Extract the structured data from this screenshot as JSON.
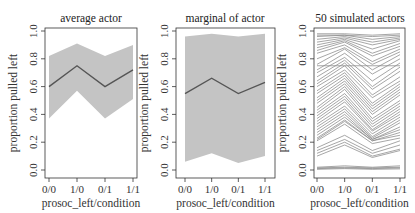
{
  "chart_data": [
    {
      "type": "line",
      "title": "average actor",
      "xlabel": "prosoc_left/condition",
      "ylabel": "proportion pulled left",
      "categories": [
        "0/0",
        "1/0",
        "0/1",
        "1/1"
      ],
      "ylim": [
        0,
        1
      ],
      "yticks": [
        "0.0",
        "0.2",
        "0.4",
        "0.6",
        "0.8",
        "1.0"
      ],
      "series": [
        {
          "name": "mean",
          "values": [
            0.6,
            0.75,
            0.6,
            0.72
          ]
        },
        {
          "name": "interval_upper",
          "values": [
            0.82,
            0.91,
            0.82,
            0.9
          ]
        },
        {
          "name": "interval_lower",
          "values": [
            0.37,
            0.57,
            0.37,
            0.51
          ]
        }
      ],
      "grid": false
    },
    {
      "type": "line",
      "title": "marginal of actor",
      "xlabel": "prosoc_left/condition",
      "ylabel": "proportion pulled left",
      "categories": [
        "0/0",
        "1/0",
        "0/1",
        "1/1"
      ],
      "ylim": [
        0,
        1
      ],
      "yticks": [
        "0.0",
        "0.2",
        "0.4",
        "0.6",
        "0.8",
        "1.0"
      ],
      "series": [
        {
          "name": "mean",
          "values": [
            0.55,
            0.66,
            0.55,
            0.63
          ]
        },
        {
          "name": "interval_upper",
          "values": [
            0.96,
            0.98,
            0.96,
            0.98
          ]
        },
        {
          "name": "interval_lower",
          "values": [
            0.06,
            0.12,
            0.05,
            0.1
          ]
        }
      ],
      "grid": false
    },
    {
      "type": "line",
      "title": "50 simulated actors",
      "xlabel": "prosoc_left/condition",
      "ylabel": "proportion pulled left",
      "categories": [
        "0/0",
        "1/0",
        "0/1",
        "1/1"
      ],
      "ylim": [
        0,
        1
      ],
      "yticks": [
        "0.0",
        "0.2",
        "0.4",
        "0.6",
        "0.8",
        "1.0"
      ],
      "series": [
        {
          "name": "actor",
          "values": [
            0.98,
            0.98,
            0.97,
            0.98
          ]
        },
        {
          "name": "actor",
          "values": [
            0.97,
            0.97,
            0.96,
            0.97
          ]
        },
        {
          "name": "actor",
          "values": [
            0.96,
            0.97,
            0.94,
            0.96
          ]
        },
        {
          "name": "actor",
          "values": [
            0.94,
            0.96,
            0.92,
            0.95
          ]
        },
        {
          "name": "actor",
          "values": [
            0.92,
            0.95,
            0.9,
            0.94
          ]
        },
        {
          "name": "actor",
          "values": [
            0.9,
            0.94,
            0.87,
            0.93
          ]
        },
        {
          "name": "actor",
          "values": [
            0.88,
            0.93,
            0.84,
            0.91
          ]
        },
        {
          "name": "actor",
          "values": [
            0.86,
            0.92,
            0.82,
            0.89
          ]
        },
        {
          "name": "actor",
          "values": [
            0.84,
            0.9,
            0.78,
            0.87
          ]
        },
        {
          "name": "actor",
          "values": [
            0.8,
            0.88,
            0.76,
            0.85
          ]
        },
        {
          "name": "actor",
          "values": [
            0.76,
            0.87,
            0.72,
            0.83
          ]
        },
        {
          "name": "actor",
          "values": [
            0.75,
            0.75,
            0.75,
            0.75
          ]
        },
        {
          "name": "actor",
          "values": [
            0.72,
            0.84,
            0.69,
            0.8
          ]
        },
        {
          "name": "actor",
          "values": [
            0.7,
            0.81,
            0.64,
            0.77
          ]
        },
        {
          "name": "actor",
          "values": [
            0.67,
            0.79,
            0.6,
            0.74
          ]
        },
        {
          "name": "actor",
          "values": [
            0.64,
            0.77,
            0.58,
            0.71
          ]
        },
        {
          "name": "actor",
          "values": [
            0.62,
            0.75,
            0.54,
            0.67
          ]
        },
        {
          "name": "actor",
          "values": [
            0.6,
            0.72,
            0.52,
            0.64
          ]
        },
        {
          "name": "actor",
          "values": [
            0.57,
            0.7,
            0.48,
            0.62
          ]
        },
        {
          "name": "actor",
          "values": [
            0.55,
            0.68,
            0.46,
            0.6
          ]
        },
        {
          "name": "actor",
          "values": [
            0.52,
            0.66,
            0.44,
            0.58
          ]
        },
        {
          "name": "actor",
          "values": [
            0.5,
            0.64,
            0.42,
            0.56
          ]
        },
        {
          "name": "actor",
          "values": [
            0.48,
            0.62,
            0.4,
            0.54
          ]
        },
        {
          "name": "actor",
          "values": [
            0.45,
            0.6,
            0.37,
            0.5
          ]
        },
        {
          "name": "actor",
          "values": [
            0.43,
            0.58,
            0.35,
            0.48
          ]
        },
        {
          "name": "actor",
          "values": [
            0.41,
            0.55,
            0.33,
            0.46
          ]
        },
        {
          "name": "actor",
          "values": [
            0.39,
            0.53,
            0.31,
            0.44
          ]
        },
        {
          "name": "actor",
          "values": [
            0.37,
            0.51,
            0.29,
            0.42
          ]
        },
        {
          "name": "actor",
          "values": [
            0.35,
            0.49,
            0.28,
            0.4
          ]
        },
        {
          "name": "actor",
          "values": [
            0.33,
            0.46,
            0.26,
            0.38
          ]
        },
        {
          "name": "actor",
          "values": [
            0.31,
            0.44,
            0.24,
            0.36
          ]
        },
        {
          "name": "actor",
          "values": [
            0.29,
            0.42,
            0.23,
            0.34
          ]
        },
        {
          "name": "actor",
          "values": [
            0.27,
            0.4,
            0.22,
            0.31
          ]
        },
        {
          "name": "actor",
          "values": [
            0.25,
            0.38,
            0.22,
            0.29
          ]
        },
        {
          "name": "actor",
          "values": [
            0.23,
            0.36,
            0.21,
            0.27
          ]
        },
        {
          "name": "actor",
          "values": [
            0.22,
            0.35,
            0.21,
            0.25
          ]
        },
        {
          "name": "actor",
          "values": [
            0.21,
            0.33,
            0.19,
            0.23
          ]
        },
        {
          "name": "actor",
          "values": [
            0.16,
            0.25,
            0.14,
            0.21
          ]
        },
        {
          "name": "actor",
          "values": [
            0.14,
            0.22,
            0.12,
            0.18
          ]
        },
        {
          "name": "actor",
          "values": [
            0.12,
            0.2,
            0.1,
            0.15
          ]
        },
        {
          "name": "actor",
          "values": [
            0.1,
            0.18,
            0.09,
            0.14
          ]
        },
        {
          "name": "actor",
          "values": [
            0.02,
            0.03,
            0.02,
            0.03
          ]
        },
        {
          "name": "actor",
          "values": [
            0.015,
            0.02,
            0.015,
            0.02
          ]
        },
        {
          "name": "actor",
          "values": [
            0.01,
            0.015,
            0.01,
            0.015
          ]
        },
        {
          "name": "actor",
          "values": [
            0.005,
            0.01,
            0.005,
            0.008
          ]
        }
      ],
      "grid": false
    }
  ],
  "panels": [
    {
      "title": "average actor",
      "xlabel": "prosoc_left/condition",
      "ylabel": "proportion pulled left"
    },
    {
      "title": "marginal of actor",
      "xlabel": "prosoc_left/condition",
      "ylabel": "proportion pulled left"
    },
    {
      "title": "50 simulated actors",
      "xlabel": "prosoc_left/condition",
      "ylabel": "proportion pulled left"
    }
  ],
  "colors": {
    "band": "#c4c4c4",
    "line": "#555555",
    "sim_line": "#8a8a8a",
    "axis": "#333333"
  }
}
